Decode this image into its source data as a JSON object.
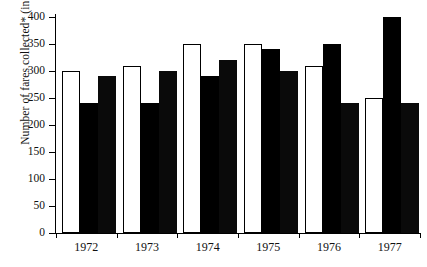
{
  "chart_data": {
    "type": "bar",
    "title": "",
    "subtitle": "",
    "xlabel": "",
    "ylabel": "Number of fares collected* (in millions)",
    "categories": [
      "1972",
      "1973",
      "1974",
      "1975",
      "1976",
      "1977"
    ],
    "series": [
      {
        "name": "series-1-white",
        "style": "white-outlined",
        "values": [
          300,
          310,
          350,
          350,
          310,
          250
        ]
      },
      {
        "name": "series-2-hatched",
        "style": "hatched-gray",
        "values": [
          240,
          240,
          290,
          340,
          350,
          400
        ]
      },
      {
        "name": "series-3-black",
        "style": "solid-black",
        "values": [
          290,
          300,
          320,
          300,
          240,
          240
        ]
      }
    ],
    "ylim": [
      0,
      400
    ],
    "ytick_values": [
      0,
      50,
      100,
      150,
      200,
      250,
      300,
      350,
      400
    ],
    "ytick_labels": [
      "0",
      "50",
      "100",
      "150",
      "200",
      "250",
      "300",
      "350",
      "400"
    ],
    "grid": false,
    "legend": null,
    "legend_position": "none",
    "annotations": []
  },
  "colors": {
    "axis": "#000000",
    "bar_white": "#ffffff",
    "bar_hatch": "#9a9a9a",
    "bar_black": "#0a0a0a",
    "background": "#ffffff"
  }
}
